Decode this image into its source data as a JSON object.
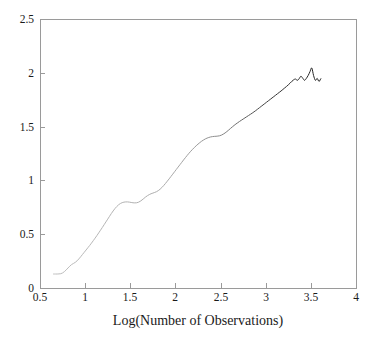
{
  "chart_data": {
    "type": "line",
    "title": "",
    "subtitle": "",
    "xlabel": "Log(Number of Observations)",
    "ylabel": "",
    "xlim": [
      0.5,
      4
    ],
    "ylim": [
      0,
      2.5
    ],
    "xticks": [
      0.5,
      1,
      1.5,
      2,
      2.5,
      3,
      3.5,
      4
    ],
    "xtick_labels": [
      "0.5",
      "1",
      "1.5",
      "2",
      "2.5",
      "3",
      "3.5",
      "4"
    ],
    "yticks": [
      0,
      0.5,
      1,
      1.5,
      2,
      2.5
    ],
    "ytick_labels": [
      "0",
      "0.5",
      "1",
      "1.5",
      "2",
      "2.5"
    ],
    "grid": false,
    "legend": null,
    "legend_position": "none",
    "annotations": [],
    "line_color_start": "#b9b9b9",
    "line_color_end": "#1f1f1f",
    "frame_color": "#9a9a9a",
    "background_color": "#ffffff",
    "series": [
      {
        "name": "curve",
        "x": [
          0.65,
          0.67,
          0.69,
          0.71,
          0.73,
          0.75,
          0.77,
          0.79,
          0.81,
          0.83,
          0.85,
          0.87,
          0.89,
          0.91,
          0.93,
          0.95,
          0.97,
          0.99,
          1.01,
          1.03,
          1.05,
          1.07,
          1.09,
          1.11,
          1.13,
          1.15,
          1.17,
          1.19,
          1.21,
          1.23,
          1.25,
          1.27,
          1.29,
          1.31,
          1.33,
          1.35,
          1.37,
          1.39,
          1.41,
          1.43,
          1.45,
          1.47,
          1.49,
          1.51,
          1.53,
          1.55,
          1.57,
          1.59,
          1.61,
          1.63,
          1.65,
          1.67,
          1.69,
          1.71,
          1.73,
          1.75,
          1.77,
          1.79,
          1.81,
          1.83,
          1.85,
          1.87,
          1.89,
          1.91,
          1.93,
          1.95,
          1.97,
          1.99,
          2.01,
          2.03,
          2.05,
          2.07,
          2.09,
          2.11,
          2.13,
          2.15,
          2.17,
          2.19,
          2.21,
          2.23,
          2.25,
          2.27,
          2.29,
          2.31,
          2.33,
          2.35,
          2.37,
          2.39,
          2.41,
          2.43,
          2.45,
          2.47,
          2.49,
          2.51,
          2.53,
          2.55,
          2.57,
          2.59,
          2.61,
          2.63,
          2.65,
          2.67,
          2.69,
          2.71,
          2.73,
          2.75,
          2.77,
          2.79,
          2.81,
          2.83,
          2.85,
          2.87,
          2.89,
          2.91,
          2.93,
          2.95,
          2.97,
          2.99,
          3.01,
          3.03,
          3.05,
          3.07,
          3.09,
          3.11,
          3.13,
          3.15,
          3.17,
          3.19,
          3.21,
          3.23,
          3.25,
          3.27,
          3.29,
          3.31,
          3.33,
          3.35,
          3.37,
          3.39,
          3.41,
          3.43,
          3.45,
          3.47,
          3.49,
          3.51,
          3.53,
          3.55,
          3.57,
          3.59,
          3.61
        ],
        "y": [
          0.13,
          0.13,
          0.13,
          0.131,
          0.133,
          0.14,
          0.152,
          0.168,
          0.186,
          0.203,
          0.218,
          0.228,
          0.238,
          0.252,
          0.27,
          0.29,
          0.311,
          0.332,
          0.353,
          0.374,
          0.395,
          0.417,
          0.44,
          0.463,
          0.487,
          0.512,
          0.537,
          0.562,
          0.588,
          0.614,
          0.64,
          0.666,
          0.692,
          0.716,
          0.738,
          0.757,
          0.773,
          0.785,
          0.793,
          0.798,
          0.8,
          0.8,
          0.798,
          0.795,
          0.792,
          0.791,
          0.792,
          0.797,
          0.806,
          0.818,
          0.832,
          0.846,
          0.858,
          0.868,
          0.876,
          0.882,
          0.888,
          0.895,
          0.905,
          0.918,
          0.934,
          0.952,
          0.972,
          0.993,
          1.014,
          1.036,
          1.058,
          1.08,
          1.102,
          1.124,
          1.146,
          1.168,
          1.19,
          1.211,
          1.232,
          1.252,
          1.271,
          1.289,
          1.306,
          1.322,
          1.337,
          1.351,
          1.364,
          1.375,
          1.385,
          1.393,
          1.399,
          1.404,
          1.407,
          1.409,
          1.41,
          1.412,
          1.415,
          1.421,
          1.43,
          1.441,
          1.454,
          1.468,
          1.483,
          1.497,
          1.511,
          1.524,
          1.536,
          1.548,
          1.559,
          1.57,
          1.581,
          1.592,
          1.603,
          1.614,
          1.625,
          1.637,
          1.649,
          1.662,
          1.675,
          1.688,
          1.701,
          1.714,
          1.727,
          1.74,
          1.753,
          1.766,
          1.779,
          1.792,
          1.805,
          1.818,
          1.831,
          1.845,
          1.859,
          1.873,
          1.888,
          1.904,
          1.921,
          1.935,
          1.942,
          1.93,
          1.945,
          1.968,
          1.95,
          1.93,
          1.948,
          1.975,
          2.01,
          2.045,
          1.975,
          1.93,
          1.948,
          1.92,
          1.945
        ],
        "noise_start_x": 2.55,
        "description": "Monotone increasing log-log style curve rising from about 0.13 at x=0.65 to about 2.0 near x=3.3, with a local plateau near x=1.45-1.55 at y=0.80, another plateau near x=2.35-2.50 at y=1.41, and increasing high-frequency oscillation beyond x=3.2 peaking at about 2.05 near x=3.51 and ending near 1.95 at x=3.61"
      }
    ]
  },
  "axes": {
    "x_title": "Log(Number of Observations)",
    "x_tick_labels": [
      "0.5",
      "1",
      "1.5",
      "2",
      "2.5",
      "3",
      "3.5",
      "4"
    ],
    "y_tick_labels": [
      "0",
      "0.5",
      "1",
      "1.5",
      "2",
      "2.5"
    ]
  }
}
